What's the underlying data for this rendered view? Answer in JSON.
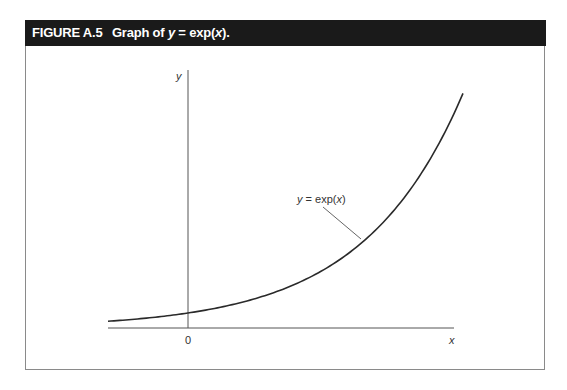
{
  "figure": {
    "number": "FIGURE A.5",
    "caption_prefix": "Graph of ",
    "caption_var": "y",
    "caption_eq": " = exp(",
    "caption_arg": "x",
    "caption_suffix": ")."
  },
  "axes": {
    "x_label": "x",
    "y_label": "y",
    "origin_label": "0"
  },
  "annotation": {
    "var": "y",
    "eq": " = exp(",
    "arg": "x",
    "close": ")"
  },
  "colors": {
    "header_bg": "#1a1a1a",
    "curve": "#2a2a2a",
    "axis": "#555555"
  },
  "chart_data": {
    "type": "line",
    "title": "Graph of y = exp(x)",
    "xlabel": "x",
    "ylabel": "y",
    "function": "y = exp(x)",
    "tick_labels": [
      "0"
    ],
    "xlim": [
      -0.8,
      2.75
    ],
    "ylim": [
      0,
      17
    ],
    "grid": false,
    "legend": null,
    "annotations": [
      {
        "text": "y = exp(x)",
        "x": 1.35,
        "y": 8.7
      }
    ],
    "series": [
      {
        "name": "y = exp(x)",
        "x": [
          -0.8,
          -0.4,
          0,
          0.4,
          0.8,
          1.2,
          1.6,
          2.0,
          2.4,
          2.75
        ],
        "values": [
          0.45,
          0.67,
          1.0,
          1.49,
          2.23,
          3.32,
          4.95,
          7.39,
          11.02,
          15.64
        ]
      }
    ]
  }
}
